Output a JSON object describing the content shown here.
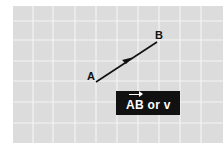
{
  "diagram": {
    "points": [
      {
        "name": "A",
        "x": 96,
        "y": 82
      },
      {
        "name": "B",
        "x": 157,
        "y": 42
      }
    ],
    "vector_label": "AB or v",
    "colors": {
      "grid_bg": "#dcdcdc",
      "grid_line": "#f4f4f4",
      "vector": "#111111",
      "label_bg": "#111111",
      "label_text": "#ffffff"
    }
  }
}
